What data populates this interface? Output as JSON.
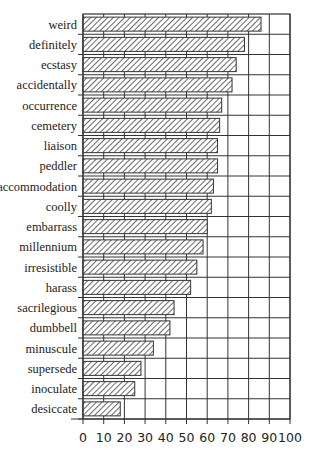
{
  "chart_data": {
    "type": "bar",
    "orientation": "horizontal",
    "title": "",
    "xlabel": "",
    "ylabel": "",
    "categories": [
      "weird",
      "definitely",
      "ecstasy",
      "accidentally",
      "occurrence",
      "cemetery",
      "liaison",
      "peddler",
      "accommodation",
      "coolly",
      "embarrass",
      "millennium",
      "irresistible",
      "harass",
      "sacrilegious",
      "dumbbell",
      "minuscule",
      "supersede",
      "inoculate",
      "desiccate"
    ],
    "values": [
      86,
      78,
      74,
      72,
      67,
      66,
      65,
      65,
      63,
      62,
      60,
      58,
      55,
      52,
      44,
      42,
      34,
      28,
      25,
      18
    ],
    "xlim": [
      0,
      100
    ],
    "xticks": [
      0,
      10,
      20,
      30,
      40,
      50,
      60,
      70,
      80,
      90,
      100
    ],
    "grid": true,
    "legend": null,
    "bar_fill": "diagonal hatch",
    "colors": {
      "bar_stroke": "#333333",
      "hatch": "#444444",
      "grid": "#333333",
      "background": "#ffffff"
    }
  }
}
